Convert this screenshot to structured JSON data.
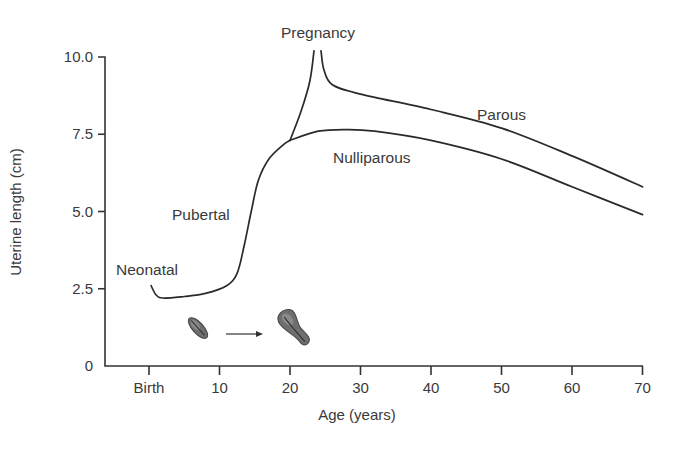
{
  "chart_data": {
    "type": "line",
    "title": "",
    "xlabel": "Age (years)",
    "ylabel": "Uterine length (cm)",
    "xlim": [
      -6,
      70
    ],
    "ylim": [
      0,
      10
    ],
    "x_ticks": [
      {
        "value": 0,
        "label": "Birth"
      },
      {
        "value": 10,
        "label": "10"
      },
      {
        "value": 20,
        "label": "20"
      },
      {
        "value": 30,
        "label": "30"
      },
      {
        "value": 40,
        "label": "40"
      },
      {
        "value": 50,
        "label": "50"
      },
      {
        "value": 60,
        "label": "60"
      },
      {
        "value": 70,
        "label": "70"
      }
    ],
    "y_ticks": [
      {
        "value": 0,
        "label": "0"
      },
      {
        "value": 2.5,
        "label": "2.5"
      },
      {
        "value": 5.0,
        "label": "5.0"
      },
      {
        "value": 7.5,
        "label": "7.5"
      },
      {
        "value": 10.0,
        "label": "10.0"
      }
    ],
    "grid": false,
    "legend": null,
    "series": [
      {
        "name": "Neonatal to pubertal growth (shared)",
        "x": [
          0.3,
          1,
          2,
          5,
          8,
          11,
          12.5,
          13.5,
          14.5,
          15.5,
          17,
          19,
          20
        ],
        "values": [
          2.6,
          2.3,
          2.2,
          2.25,
          2.35,
          2.6,
          3.0,
          3.9,
          5.0,
          6.0,
          6.7,
          7.15,
          7.3
        ]
      },
      {
        "name": "Nulliparous",
        "x": [
          20,
          24,
          28,
          32,
          40,
          50,
          60,
          70
        ],
        "values": [
          7.3,
          7.6,
          7.65,
          7.6,
          7.3,
          6.7,
          5.8,
          4.9
        ]
      },
      {
        "name": "Pregnancy",
        "x": [
          20,
          21.5,
          22.8,
          23.4
        ],
        "values": [
          7.3,
          8.2,
          9.2,
          10.2
        ]
      },
      {
        "name": "Parous",
        "x": [
          24.4,
          24.8,
          26,
          30,
          40,
          50,
          60,
          70
        ],
        "values": [
          10.2,
          9.6,
          9.1,
          8.8,
          8.3,
          7.7,
          6.8,
          5.8
        ]
      }
    ],
    "annotations": [
      {
        "text": "Neonatal",
        "x": -4.6,
        "y": 3.1
      },
      {
        "text": "Pubertal",
        "x": 3.2,
        "y": 4.8
      },
      {
        "text": "Pregnancy",
        "x": 24.2,
        "y": 10.9
      },
      {
        "text": "Nulliparous",
        "x": 30.2,
        "y": 6.8
      },
      {
        "text": "Parous",
        "x": 46.6,
        "y": 8.2
      }
    ],
    "illustrations": [
      {
        "name": "prepubertal-uterus-icon",
        "x": 7,
        "y": 1.25,
        "size": "small"
      },
      {
        "name": "arrow-icon",
        "from_x": 11,
        "to_x": 16.5,
        "y": 1.05
      },
      {
        "name": "adult-uterus-icon",
        "x": 21.5,
        "y": 1.25,
        "size": "large"
      }
    ]
  },
  "labels": {
    "xlabel": "Age (years)",
    "ylabel": "Uterine length (cm)",
    "neonatal": "Neonatal",
    "pubertal": "Pubertal",
    "pregnancy": "Pregnancy",
    "nulliparous": "Nulliparous",
    "parous": "Parous"
  },
  "colors": {
    "line": "#2a2a2a",
    "text": "#3a3a3a",
    "uterus_fill": "#6e6e6e"
  }
}
